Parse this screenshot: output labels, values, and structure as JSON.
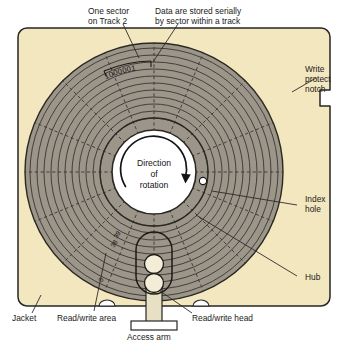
{
  "diagram": {
    "colors": {
      "jacket": "#f2e7bf",
      "jacket_edge": "#262626",
      "disk_surface": "#9b958a",
      "hub_fill": "#ffffff",
      "ink": "#1a1a1a",
      "track_line": "#34302a",
      "head_fill": "#f3ecd6",
      "arm_fill": "#e8e0c4",
      "background": "#ffffff"
    },
    "geometry": {
      "jacket": {
        "x": 18,
        "y": 28,
        "width": 312,
        "height": 278,
        "corner_radius": 9
      },
      "disk": {
        "cx": 154,
        "cy": 172,
        "r_outer": 129,
        "r_inner_band": 54,
        "r_hub": 42
      },
      "index_hole": {
        "cx": 203,
        "cy": 181,
        "r": 3.6
      },
      "write_protect_notch": {
        "x": 320,
        "y": 90,
        "width": 10,
        "height": 16
      },
      "tracks_count": 11,
      "sectors_count": 16
    },
    "hub_label": {
      "line1": "Direction",
      "line2": "of",
      "line3": "rotation"
    },
    "sector_data": {
      "bits": "1000001"
    },
    "track_numbers": [
      {
        "label": "39"
      },
      {
        "label": "38"
      },
      {
        "label": "0"
      }
    ],
    "callouts": {
      "one_sector": {
        "line1": "One sector",
        "line2": "on Track 2"
      },
      "serial_storage": {
        "line1": "Data are stored serially",
        "line2": "by sector within a track"
      },
      "write_protect": {
        "line1": "Write",
        "line2": "protect",
        "line3": "notch"
      },
      "index_hole": {
        "line1": "Index",
        "line2": "hole"
      },
      "hub": {
        "line1": "Hub"
      },
      "jacket": {
        "line1": "Jacket"
      },
      "read_write_area": {
        "line1": "Read/write area"
      },
      "read_write_head": {
        "line1": "Read/write head"
      },
      "access_arm": {
        "line1": "Access arm"
      }
    }
  }
}
